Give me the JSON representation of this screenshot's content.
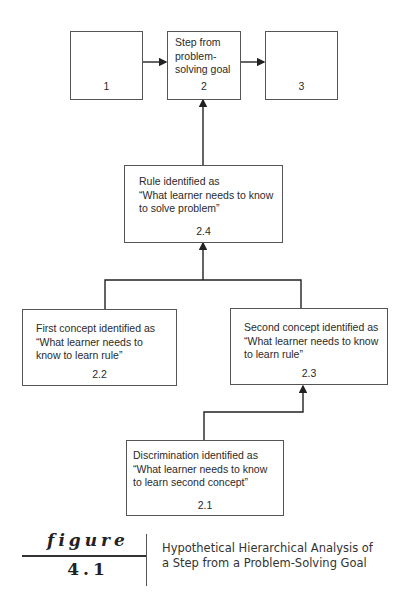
{
  "diagram": {
    "boxes": {
      "b1": {
        "text": "",
        "number": "1"
      },
      "b2": {
        "text": "Step from\nproblem-\nsolving goal",
        "number": "2"
      },
      "b3": {
        "text": "",
        "number": "3"
      },
      "b24": {
        "text": "Rule identified as\n“What learner needs to know\nto solve problem”",
        "number": "2.4"
      },
      "b22": {
        "text": "First concept identified as\n“What learner needs to\nknow to learn rule”",
        "number": "2.2"
      },
      "b23": {
        "text": "Second concept identified as\n“What learner needs to know\nto learn rule”",
        "number": "2.3"
      },
      "b21": {
        "text": "Discrimination identified as\n“What learner needs to know\nto learn second concept”",
        "number": "2.1"
      }
    },
    "edges": [
      {
        "from": "1",
        "to": "2"
      },
      {
        "from": "2",
        "to": "3"
      },
      {
        "from": "2.4",
        "to": "2"
      },
      {
        "from": "2.2",
        "to": "2.4"
      },
      {
        "from": "2.3",
        "to": "2.4"
      },
      {
        "from": "2.1",
        "to": "2.3"
      }
    ]
  },
  "figure": {
    "word": "figure",
    "number": "4.1",
    "caption": "Hypothetical Hierarchical Analysis of\na Step from a Problem-Solving Goal"
  }
}
